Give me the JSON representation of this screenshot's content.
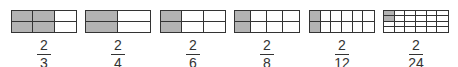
{
  "colors": {
    "shaded": "#b3b3b3",
    "line": "#333333",
    "background": "#ffffff"
  },
  "models": [
    {
      "left": 11,
      "cols": 3,
      "rows": 2,
      "shaded_cols": 2,
      "shaded_rows": 2,
      "numerator": "2",
      "denominator": "3"
    },
    {
      "left": 85,
      "cols": 2,
      "rows": 2,
      "shaded_cols": 1,
      "shaded_rows": 2,
      "numerator": "2",
      "denominator": "4"
    },
    {
      "left": 160,
      "cols": 3,
      "rows": 2,
      "shaded_cols": 1,
      "shaded_rows": 2,
      "numerator": "2",
      "denominator": "6"
    },
    {
      "left": 234,
      "cols": 4,
      "rows": 2,
      "shaded_cols": 1,
      "shaded_rows": 2,
      "numerator": "2",
      "denominator": "8"
    },
    {
      "left": 309,
      "cols": 6,
      "rows": 2,
      "shaded_cols": 1,
      "shaded_rows": 2,
      "numerator": "2",
      "denominator": "12"
    },
    {
      "left": 383,
      "cols": 6,
      "rows": 4,
      "shaded_cols": 1,
      "shaded_rows": 2,
      "numerator": "2",
      "denominator": "24"
    }
  ]
}
